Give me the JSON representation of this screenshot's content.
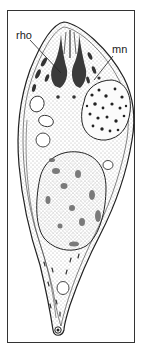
{
  "figure": {
    "type": "scientific-illustration",
    "labels": [
      {
        "id": "rho",
        "text": "rho"
      },
      {
        "id": "mn",
        "text": "mn"
      }
    ]
  },
  "colors": {
    "ink": "#222222",
    "frame": "#333333",
    "background": "#ffffff",
    "stipple": "#555555"
  }
}
